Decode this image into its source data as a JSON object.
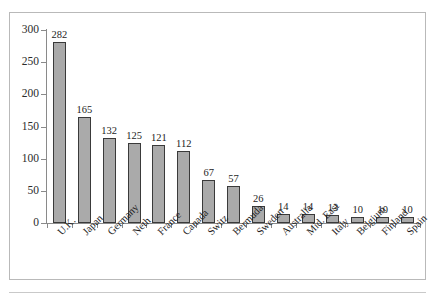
{
  "chart_data": {
    "type": "bar",
    "title": "",
    "subtitle": "",
    "xlabel": "",
    "ylabel": "",
    "ylim": [
      0,
      300
    ],
    "yticks": [
      0,
      50,
      100,
      150,
      200,
      250,
      300
    ],
    "grid": false,
    "legend": null,
    "bar_fill_color": "#aaaaaa",
    "bar_border_color": "#3a3a3a",
    "axis_color": "#8a8a8a",
    "frame_color": "#b9b9b9",
    "categories": [
      "U.K.",
      "Japan",
      "Germany",
      "Neth",
      "France",
      "Canada",
      "Switz",
      "Bermuda",
      "Sweden",
      "Australia",
      "Mid. East",
      "Italy",
      "Belgium",
      "Finland",
      "Spain"
    ],
    "values": [
      282,
      165,
      132,
      125,
      121,
      112,
      67,
      57,
      26,
      14,
      14,
      13,
      10,
      10,
      10
    ],
    "data_labels": [
      "282",
      "165",
      "132",
      "125",
      "121",
      "112",
      "67",
      "57",
      "26",
      "14",
      "14",
      "13",
      "10",
      "10",
      "10"
    ],
    "ytick_labels": [
      "0",
      "50",
      "100",
      "150",
      "200",
      "250",
      "300"
    ]
  }
}
